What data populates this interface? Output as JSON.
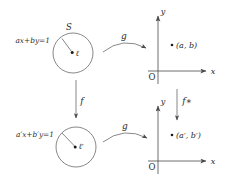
{
  "diagram": {
    "accent_color": "#2b2b2b",
    "line_color": "#555555",
    "background": "#ffffff",
    "top_left": {
      "set_label": "S",
      "equation_label": "ax+by=1",
      "point_label": "ℓ"
    },
    "bottom_left": {
      "equation_label": "a′x+b′y=1",
      "point_label": "ℓ′"
    },
    "top_right": {
      "y_axis_label": "y",
      "x_axis_label": "x",
      "origin_label": "O",
      "point_label": "(a, b)"
    },
    "bottom_right": {
      "y_axis_label": "y",
      "x_axis_label": "x",
      "origin_label": "O",
      "point_label": "(a′, b′)"
    },
    "arrows": {
      "top_horizontal": "g",
      "bottom_horizontal": "g",
      "left_vertical": "f",
      "right_vertical": "f∗"
    }
  }
}
